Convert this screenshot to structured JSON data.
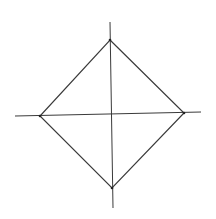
{
  "diagram": {
    "colors": {
      "background": "#ffffff",
      "stroke": "#3a3a3a"
    },
    "vertical_axis": {
      "x1": 110,
      "y1": 22,
      "x2": 113,
      "y2": 208
    },
    "horizontal_axis": {
      "x1": 15,
      "y1": 116,
      "x2": 201,
      "y2": 112
    },
    "vertices": {
      "top": [
        110,
        40
      ],
      "right": [
        184,
        113
      ],
      "bottom": [
        112,
        188
      ],
      "left": [
        40,
        116
      ]
    }
  }
}
